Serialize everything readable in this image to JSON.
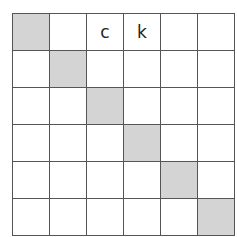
{
  "grid": {
    "rows": 6,
    "cols": 6,
    "shade_color": "#d4d4d4",
    "line_color": "#555555",
    "cells": [
      [
        "",
        "",
        "c",
        "k",
        "",
        ""
      ],
      [
        "",
        "",
        "",
        "",
        "",
        ""
      ],
      [
        "",
        "",
        "",
        "",
        "",
        ""
      ],
      [
        "",
        "",
        "",
        "",
        "",
        ""
      ],
      [
        "",
        "",
        "",
        "",
        "",
        ""
      ],
      [
        "",
        "",
        "",
        "",
        "",
        ""
      ]
    ],
    "shaded": [
      [
        0,
        0
      ],
      [
        1,
        1
      ],
      [
        2,
        2
      ],
      [
        3,
        3
      ],
      [
        4,
        4
      ],
      [
        5,
        5
      ]
    ]
  }
}
